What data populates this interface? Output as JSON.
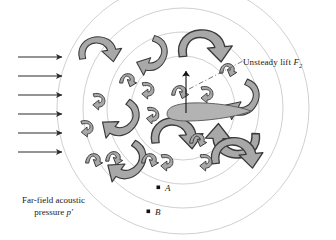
{
  "figure": {
    "colors": {
      "background": "#ffffff",
      "ink": "#1a1a1a",
      "airfoil_fill": "#b3b3b3",
      "airfoil_stroke": "#4d4d4d",
      "vortex_fill": "#a8a8a8",
      "vortex_stroke": "#3d3d3d",
      "wave_stroke": "#c8c8c8",
      "inflow_arrow": "#2b2b2b",
      "leader_line": "#555555"
    }
  },
  "annotations": {
    "lift_label": {
      "text_main": "Unsteady lift ",
      "symbol": "F",
      "subscript": "2"
    },
    "farfield_label": {
      "line1": "Far-field acoustic",
      "line2_prefix": "pressure ",
      "line2_symbol": "p′"
    },
    "point_a": "A",
    "point_b": "B"
  },
  "geometry": {
    "acoustic_waves": {
      "center_x": 183,
      "center_y": 108,
      "radii": [
        52,
        76,
        100,
        126
      ]
    },
    "airfoil": {
      "leading_edge_x": 165,
      "trailing_edge_x": 250,
      "chord_y": 113,
      "thickness": 9
    },
    "lift_arrow": {
      "x": 186,
      "y_base": 112,
      "y_tip": 68
    },
    "leader_line": {
      "x1": 190,
      "y1": 88,
      "x2": 242,
      "y2": 61
    },
    "observer_points": [
      {
        "name": "A",
        "x": 159,
        "y": 188
      },
      {
        "name": "B",
        "x": 149,
        "y": 212
      }
    ]
  },
  "inflow_arrows": {
    "count": 6,
    "x_start": 18,
    "x_end": 66,
    "y_values": [
      57,
      76,
      95,
      114,
      133,
      152
    ]
  },
  "vortices": {
    "large": [
      {
        "id": "v-top-left",
        "x": 96,
        "y": 53,
        "rot": -8,
        "scale": 1.0
      },
      {
        "id": "v-top-mid",
        "x": 152,
        "y": 52,
        "rot": 112,
        "scale": 0.95
      },
      {
        "id": "v-top-right",
        "x": 200,
        "y": 50,
        "rot": -5,
        "scale": 1.25
      },
      {
        "id": "v-left-mid",
        "x": 122,
        "y": 116,
        "rot": 128,
        "scale": 1.05
      },
      {
        "id": "v-right-mid",
        "x": 243,
        "y": 96,
        "rot": 118,
        "scale": 1.0
      },
      {
        "id": "v-bot-left",
        "x": 128,
        "y": 158,
        "rot": 126,
        "scale": 1.1
      },
      {
        "id": "v-bot-mid",
        "x": 172,
        "y": 137,
        "rot": -4,
        "scale": 1.2
      },
      {
        "id": "v-bot-right",
        "x": 238,
        "y": 138,
        "rot": 182,
        "scale": 1.25
      },
      {
        "id": "v-bot-right2",
        "x": 232,
        "y": 157,
        "rot": -6,
        "scale": 1.2
      }
    ],
    "small": [
      {
        "id": "s1",
        "x": 126,
        "y": 80,
        "rot": 20
      },
      {
        "id": "s2",
        "x": 98,
        "y": 99,
        "rot": 92
      },
      {
        "id": "s3",
        "x": 86,
        "y": 126,
        "rot": 88
      },
      {
        "id": "s4",
        "x": 92,
        "y": 160,
        "rot": 20
      },
      {
        "id": "s5",
        "x": 147,
        "y": 88,
        "rot": 92
      },
      {
        "id": "s6",
        "x": 178,
        "y": 92,
        "rot": 18
      },
      {
        "id": "s7",
        "x": 206,
        "y": 92,
        "rot": 90
      },
      {
        "id": "s8",
        "x": 152,
        "y": 113,
        "rot": 96
      },
      {
        "id": "s9",
        "x": 226,
        "y": 70,
        "rot": 18
      },
      {
        "id": "s10",
        "x": 196,
        "y": 140,
        "rot": 18
      },
      {
        "id": "s11",
        "x": 148,
        "y": 160,
        "rot": 20
      },
      {
        "id": "s12",
        "x": 166,
        "y": 160,
        "rot": 92
      },
      {
        "id": "s13",
        "x": 205,
        "y": 160,
        "rot": 92
      },
      {
        "id": "s14",
        "x": 112,
        "y": 158,
        "rot": 18
      }
    ]
  }
}
